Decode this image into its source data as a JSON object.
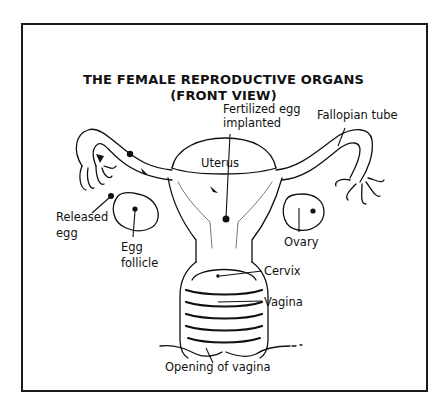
{
  "diagram": {
    "title_line1": "THE FEMALE REPRODUCTIVE ORGANS",
    "title_line2": "(FRONT VIEW)",
    "labels": {
      "fertilized_egg_line1": "Fertilized egg",
      "fertilized_egg_line2": "implanted",
      "fallopian_tube": "Fallopian tube",
      "uterus": "Uterus",
      "released_egg_line1": "Released",
      "released_egg_line2": "egg",
      "egg_follicle_line1": "Egg",
      "egg_follicle_line2": "follicle",
      "ovary": "Ovary",
      "cervix": "Cervix",
      "vagina": "Vagina",
      "opening_of_vagina": "Opening of vagina"
    },
    "colors": {
      "ink": "#111111",
      "background": "#ffffff",
      "shading": "#cfcfcf"
    }
  }
}
